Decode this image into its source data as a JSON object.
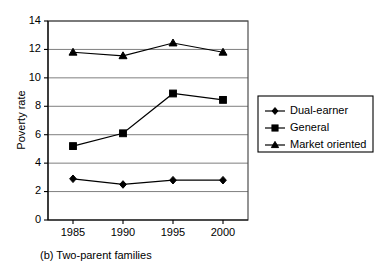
{
  "chart_data": {
    "type": "line",
    "title": "",
    "caption": "(b) Two-parent families",
    "xlabel": "",
    "ylabel": "Poverty rate",
    "categories": [
      "1985",
      "1990",
      "1995",
      "2000"
    ],
    "x": [
      1985,
      1990,
      1995,
      2000
    ],
    "xlim": [
      1982.5,
      2002.5
    ],
    "ylim": [
      0,
      14
    ],
    "yticks": [
      0,
      2,
      4,
      6,
      8,
      10,
      12,
      14
    ],
    "ytick_labels": [
      "0",
      "2",
      "4",
      "6",
      "8",
      "10",
      "12",
      "14"
    ],
    "grid": "horizontal",
    "legend_position": "right",
    "series": [
      {
        "name": "Dual-earner",
        "marker": "diamond",
        "color": "#000000",
        "values": [
          2.9,
          2.5,
          2.8,
          2.8
        ]
      },
      {
        "name": "General",
        "marker": "square",
        "color": "#000000",
        "values": [
          5.2,
          6.1,
          8.9,
          8.45
        ]
      },
      {
        "name": "Market oriented",
        "marker": "triangle",
        "color": "#000000",
        "values": [
          11.8,
          11.55,
          12.45,
          11.8
        ]
      }
    ]
  },
  "legend": {
    "items": [
      {
        "label": "Dual-earner",
        "marker": "diamond"
      },
      {
        "label": "General",
        "marker": "square"
      },
      {
        "label": "Market oriented",
        "marker": "triangle"
      }
    ]
  },
  "axes": {
    "y_title": "Poverty rate",
    "y_tick_labels": [
      "14",
      "12",
      "10",
      "8",
      "6",
      "4",
      "2",
      "0"
    ],
    "x_tick_labels": [
      "1985",
      "1990",
      "1995",
      "2000"
    ]
  },
  "caption": {
    "text": "(b) Two-parent families"
  }
}
